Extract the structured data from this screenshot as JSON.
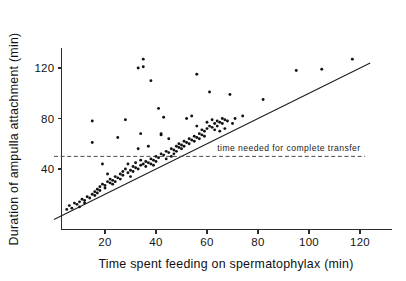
{
  "figure": {
    "background_color": "#ffffff",
    "point_color": "#121212",
    "axis_color": "#2b2b2b",
    "reference_line_color": "#4a4a4a"
  },
  "chart_data": {
    "type": "scatter",
    "title": "",
    "xlabel": "Time spent feeding on spermatophylax (min)",
    "ylabel": "Duration of ampulla attachment (min)",
    "xlim": [
      0,
      134
    ],
    "ylim": [
      0,
      136
    ],
    "xticks": [
      20,
      40,
      60,
      80,
      100,
      120
    ],
    "yticks": [
      40,
      80,
      120
    ],
    "xticklabels": [
      "20",
      "40",
      "60",
      "80",
      "100",
      "120"
    ],
    "yticklabels": [
      "40",
      "80",
      "120"
    ],
    "grid": false,
    "legend": null,
    "annotations": [
      {
        "name": "complete-transfer-reference",
        "text": "time needed for complete transfer",
        "type": "horizontal-dashed-line",
        "y_value": 50,
        "x_start": 0,
        "x_end": 122,
        "label_x": 64,
        "label_y": 54
      },
      {
        "name": "equality-line",
        "text": "",
        "type": "diagonal-solid-line",
        "from": [
          0,
          0
        ],
        "to": [
          124,
          124
        ]
      }
    ],
    "series": [
      {
        "name": "ampulla attachment vs feeding time",
        "marker": "filled-circle",
        "color": "#121212",
        "points": [
          [
            5,
            8
          ],
          [
            6,
            11
          ],
          [
            7,
            9
          ],
          [
            8,
            13
          ],
          [
            9,
            12
          ],
          [
            10,
            14
          ],
          [
            10,
            10
          ],
          [
            11,
            16
          ],
          [
            12,
            15
          ],
          [
            12,
            13
          ],
          [
            13,
            18
          ],
          [
            14,
            17
          ],
          [
            15,
            20
          ],
          [
            15,
            78
          ],
          [
            15,
            61
          ],
          [
            16,
            22
          ],
          [
            16,
            19
          ],
          [
            17,
            24
          ],
          [
            17,
            21
          ],
          [
            18,
            26
          ],
          [
            18,
            23
          ],
          [
            19,
            28
          ],
          [
            19,
            44
          ],
          [
            20,
            27
          ],
          [
            20,
            25
          ],
          [
            21,
            30
          ],
          [
            21,
            36
          ],
          [
            22,
            29
          ],
          [
            22,
            32
          ],
          [
            23,
            31
          ],
          [
            23,
            28
          ],
          [
            24,
            34
          ],
          [
            24,
            30
          ],
          [
            25,
            33
          ],
          [
            25,
            65
          ],
          [
            26,
            36
          ],
          [
            26,
            32
          ],
          [
            27,
            38
          ],
          [
            27,
            35
          ],
          [
            28,
            79
          ],
          [
            28,
            40
          ],
          [
            29,
            37
          ],
          [
            29,
            44
          ],
          [
            30,
            39
          ],
          [
            30,
            34
          ],
          [
            31,
            42
          ],
          [
            31,
            38
          ],
          [
            32,
            41
          ],
          [
            32,
            45
          ],
          [
            33,
            40
          ],
          [
            33,
            120
          ],
          [
            33,
            56
          ],
          [
            34,
            43
          ],
          [
            34,
            68
          ],
          [
            34,
            47
          ],
          [
            35,
            44
          ],
          [
            35,
            121
          ],
          [
            35,
            127
          ],
          [
            36,
            46
          ],
          [
            36,
            42
          ],
          [
            37,
            45
          ],
          [
            37,
            58
          ],
          [
            38,
            48
          ],
          [
            38,
            110
          ],
          [
            38,
            44
          ],
          [
            39,
            47
          ],
          [
            39,
            43
          ],
          [
            40,
            50
          ],
          [
            40,
            46
          ],
          [
            41,
            49
          ],
          [
            41,
            88
          ],
          [
            42,
            52
          ],
          [
            42,
            67
          ],
          [
            42,
            68
          ],
          [
            43,
            51
          ],
          [
            43,
            81
          ],
          [
            44,
            54
          ],
          [
            44,
            48
          ],
          [
            45,
            53
          ],
          [
            45,
            64
          ],
          [
            46,
            56
          ],
          [
            46,
            50
          ],
          [
            47,
            55
          ],
          [
            47,
            52
          ],
          [
            48,
            58
          ],
          [
            48,
            54
          ],
          [
            49,
            57
          ],
          [
            49,
            60
          ],
          [
            50,
            59
          ],
          [
            50,
            56
          ],
          [
            51,
            62
          ],
          [
            51,
            58
          ],
          [
            52,
            61
          ],
          [
            52,
            80
          ],
          [
            53,
            64
          ],
          [
            53,
            60
          ],
          [
            54,
            63
          ],
          [
            54,
            82
          ],
          [
            55,
            66
          ],
          [
            55,
            62
          ],
          [
            56,
            65
          ],
          [
            56,
            74
          ],
          [
            56,
            115
          ],
          [
            57,
            68
          ],
          [
            57,
            64
          ],
          [
            58,
            67
          ],
          [
            58,
            71
          ],
          [
            59,
            70
          ],
          [
            59,
            66
          ],
          [
            60,
            72
          ],
          [
            60,
            77
          ],
          [
            61,
            74
          ],
          [
            61,
            101
          ],
          [
            62,
            73
          ],
          [
            62,
            79
          ],
          [
            63,
            76
          ],
          [
            63,
            71
          ],
          [
            64,
            78
          ],
          [
            64,
            74
          ],
          [
            65,
            77
          ],
          [
            65,
            70
          ],
          [
            66,
            80
          ],
          [
            66,
            76
          ],
          [
            67,
            79
          ],
          [
            67,
            72
          ],
          [
            68,
            78
          ],
          [
            69,
            99
          ],
          [
            70,
            76
          ],
          [
            71,
            80
          ],
          [
            74,
            82
          ],
          [
            82,
            95
          ],
          [
            95,
            118
          ],
          [
            105,
            119
          ],
          [
            117,
            127
          ]
        ]
      }
    ]
  },
  "axis_titles": {
    "x": "Time spent feeding on spermatophylax (min)",
    "y": "Duration of ampulla attachment (min)"
  }
}
